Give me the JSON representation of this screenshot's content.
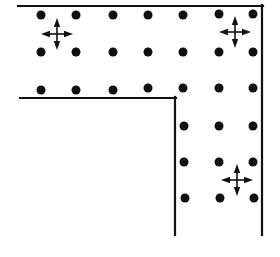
{
  "diagram": {
    "type": "L-shaped corridor with dot grid and movement markers",
    "colors": {
      "background": "#ffffff",
      "ink": "#111111"
    },
    "walls": [
      {
        "name": "outer-top-wall",
        "x1": 18,
        "y1": 6,
        "x2": 263,
        "y2": 6
      },
      {
        "name": "outer-right-wall",
        "x1": 262,
        "y1": 5,
        "x2": 262,
        "y2": 235
      },
      {
        "name": "inner-top-wall",
        "x1": 20,
        "y1": 98,
        "x2": 176,
        "y2": 98
      },
      {
        "name": "inner-left-wall",
        "x1": 175,
        "y1": 97,
        "x2": 175,
        "y2": 235
      }
    ],
    "dots": [
      [
        41,
        15
      ],
      [
        76,
        15
      ],
      [
        113,
        15
      ],
      [
        148,
        15
      ],
      [
        183,
        15
      ],
      [
        219,
        14
      ],
      [
        253,
        14
      ],
      [
        41,
        52
      ],
      [
        76,
        52
      ],
      [
        113,
        52
      ],
      [
        148,
        52
      ],
      [
        183,
        52
      ],
      [
        219,
        52
      ],
      [
        253,
        52
      ],
      [
        41,
        90
      ],
      [
        76,
        90
      ],
      [
        113,
        90
      ],
      [
        148,
        88
      ],
      [
        183,
        88
      ],
      [
        219,
        88
      ],
      [
        253,
        88
      ],
      [
        184,
        126
      ],
      [
        219,
        126
      ],
      [
        253,
        126
      ],
      [
        184,
        162
      ],
      [
        219,
        162
      ],
      [
        253,
        162
      ],
      [
        185,
        198
      ],
      [
        220,
        198
      ],
      [
        254,
        198
      ]
    ],
    "dot_radius": 4.5,
    "move_markers": [
      {
        "name": "move-marker-top-left",
        "x": 57,
        "y": 34
      },
      {
        "name": "move-marker-top-right",
        "x": 235,
        "y": 32
      },
      {
        "name": "move-marker-bottom-right",
        "x": 237,
        "y": 180
      }
    ]
  }
}
